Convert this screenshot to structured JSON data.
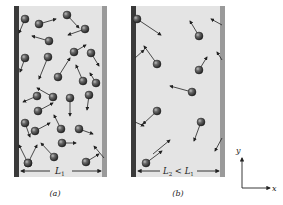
{
  "figure": {
    "colors": {
      "background": "#ffffff",
      "container_fill": "#e4e4e4",
      "left_wall": "#3a3a3a",
      "right_wall": "#9a9a9a",
      "molecule": "#3c3c3c",
      "arrow": "#222222"
    }
  },
  "panels": [
    {
      "id": "a",
      "caption": "(a)",
      "width_label_main": "L",
      "width_label_sub": "1",
      "box": {
        "x": 14,
        "y": 6,
        "w": 93,
        "h": 171
      },
      "molecules": [
        {
          "x": 25,
          "y": 19,
          "dx": -6,
          "dy": 14
        },
        {
          "x": 39,
          "y": 24,
          "dx": 17,
          "dy": -5
        },
        {
          "x": 67,
          "y": 15,
          "dx": 12,
          "dy": 13
        },
        {
          "x": 85,
          "y": 29,
          "dx": -17,
          "dy": 6
        },
        {
          "x": 49,
          "y": 41,
          "dx": -17,
          "dy": -5
        },
        {
          "x": 25,
          "y": 58,
          "dx": -5,
          "dy": 14
        },
        {
          "x": 48,
          "y": 57,
          "dx": -9,
          "dy": 22
        },
        {
          "x": 74,
          "y": 52,
          "dx": 12,
          "dy": -7
        },
        {
          "x": 91,
          "y": 53,
          "dx": 8,
          "dy": 13
        },
        {
          "x": 58,
          "y": 77,
          "dx": 12,
          "dy": -19
        },
        {
          "x": 83,
          "y": 81,
          "dx": -7,
          "dy": -16
        },
        {
          "x": 37,
          "y": 96,
          "dx": -14,
          "dy": 6
        },
        {
          "x": 53,
          "y": 97,
          "dx": -16,
          "dy": -9
        },
        {
          "x": 70,
          "y": 98,
          "dx": 0,
          "dy": 18
        },
        {
          "x": 89,
          "y": 95,
          "dx": -2,
          "dy": 15
        },
        {
          "x": 38,
          "y": 111,
          "dx": 15,
          "dy": -8
        },
        {
          "x": 96,
          "y": 83,
          "dx": -6,
          "dy": -10
        },
        {
          "x": 25,
          "y": 123,
          "dx": 5,
          "dy": 14
        },
        {
          "x": 35,
          "y": 131,
          "dx": 15,
          "dy": -8
        },
        {
          "x": 61,
          "y": 129,
          "dx": -7,
          "dy": -14
        },
        {
          "x": 79,
          "y": 129,
          "dx": 14,
          "dy": 5
        },
        {
          "x": 62,
          "y": 143,
          "dx": 14,
          "dy": 0
        },
        {
          "x": 28,
          "y": 163,
          "dx": -9,
          "dy": -18
        },
        {
          "x": 54,
          "y": 157,
          "dx": -13,
          "dy": -14
        },
        {
          "x": 86,
          "y": 162,
          "dx": 13,
          "dy": -8
        },
        {
          "x": 28,
          "y": 163,
          "dx": 9,
          "dy": -18
        }
      ],
      "extra_arrows": [
        {
          "x1": 104,
          "y1": 158,
          "x2": 94,
          "y2": 146
        }
      ]
    },
    {
      "id": "b",
      "caption": "(b)",
      "width_label_main": "L",
      "width_label_sub": "2",
      "width_label_rest": " < L",
      "width_label_rest_sub": "1",
      "box": {
        "x": 131,
        "y": 6,
        "w": 94,
        "h": 171
      },
      "molecules": [
        {
          "x": 137,
          "y": 19,
          "dx": 24,
          "dy": 16
        },
        {
          "x": 199,
          "y": 36,
          "dx": -9,
          "dy": -15
        },
        {
          "x": 157,
          "y": 64,
          "dx": -13,
          "dy": -18
        },
        {
          "x": 199,
          "y": 70,
          "dx": 8,
          "dy": -13
        },
        {
          "x": 192,
          "y": 92,
          "dx": -22,
          "dy": -6
        },
        {
          "x": 157,
          "y": 111,
          "dx": -14,
          "dy": 13
        },
        {
          "x": 201,
          "y": 122,
          "dx": -7,
          "dy": 19
        },
        {
          "x": 146,
          "y": 163,
          "dx": 16,
          "dy": -12
        }
      ],
      "extra_arrows": [
        {
          "x1": 222,
          "y1": 25,
          "x2": 211,
          "y2": 19
        },
        {
          "x1": 222,
          "y1": 60,
          "x2": 217,
          "y2": 52
        },
        {
          "x1": 135,
          "y1": 122,
          "x2": 144,
          "y2": 126
        },
        {
          "x1": 135,
          "y1": 58,
          "x2": 144,
          "y2": 50
        },
        {
          "x1": 222,
          "y1": 138,
          "x2": 215,
          "y2": 151
        },
        {
          "x1": 153,
          "y1": 154,
          "x2": 170,
          "y2": 140
        }
      ]
    }
  ],
  "axes": {
    "x_label": "x",
    "y_label": "y",
    "origin": {
      "x": 242,
      "y": 188
    }
  }
}
